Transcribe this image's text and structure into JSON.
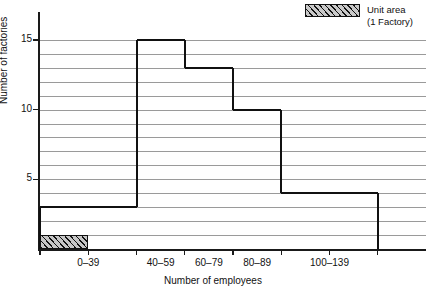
{
  "legend": {
    "swatch_name": "unit-area-hatched-swatch",
    "line1": "Unit area",
    "line2": "(1 Factory)"
  },
  "axes": {
    "ylabel": "Number of factories",
    "xlabel": "Number of employees",
    "ytick_labels": [
      "5",
      "10",
      "15"
    ],
    "xtick_labels": [
      "0–39",
      "40–59",
      "60–79",
      "80–89",
      "100–139"
    ]
  },
  "colors": {
    "ink": "#111111",
    "grid": "#9a9a9a",
    "hatch_fill": "#c6c6c6",
    "background": "#ffffff"
  },
  "chart_data": {
    "type": "bar",
    "title": "",
    "subtitle": "",
    "xlabel": "Number of employees",
    "ylabel": "Number of factories",
    "categories": [
      "0–39",
      "40–59",
      "60–79",
      "80–89",
      "100–139"
    ],
    "values": [
      3,
      15,
      13,
      10,
      4
    ],
    "bin_edges": [
      0,
      40,
      60,
      80,
      100,
      140
    ],
    "bin_widths": [
      40,
      20,
      20,
      20,
      40
    ],
    "ylim": [
      0,
      17
    ],
    "xlim": [
      0,
      160
    ],
    "ytick_values": [
      5,
      10,
      15
    ],
    "gridlines_at": [
      1,
      2,
      3,
      4,
      5,
      6,
      7,
      8,
      9,
      10,
      11,
      12,
      13,
      14,
      15
    ],
    "grid": true,
    "legend_position": "top-right",
    "legend_entries": [
      "Unit area (1 Factory)"
    ],
    "unit_area_box": {
      "label": "Unit area (1 Factory)",
      "width_units": 20,
      "height_units": 1,
      "x_start": 0
    },
    "annotations": [
      "Histogram with unequal class widths; bar heights are frequency densities scaled so area = frequency.",
      "Shaded key rectangle at bottom-left represents one factory of unit area."
    ]
  }
}
